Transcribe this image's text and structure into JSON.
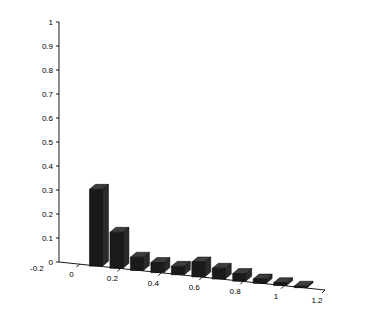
{
  "figure": {
    "background_color": "#ffffff",
    "bar_color": "#1a1a1a",
    "bar_top_color": "#3d3d3d",
    "bar_side_color": "#2b2b2b",
    "axis_color": "#000000"
  },
  "axes": {
    "y_ticks": [
      "1",
      "0.9",
      "0.8",
      "0.7",
      "0.6",
      "0.5",
      "0.4",
      "0.3",
      "0.2",
      "0.1",
      "0"
    ],
    "x_ticks": [
      "0",
      "0.2",
      "0.4",
      "0.6",
      "0.8",
      "1",
      "1.2"
    ],
    "depth_label": "-0.2"
  },
  "chart_data": {
    "type": "bar",
    "title": "",
    "xlabel": "",
    "ylabel": "",
    "style": "3d-bar",
    "categories": [
      "0",
      "0.1",
      "0.2",
      "0.3",
      "0.4",
      "0.5",
      "0.6",
      "0.7",
      "0.8",
      "0.9",
      "1"
    ],
    "x": [
      0,
      0.1,
      0.2,
      0.3,
      0.4,
      0.5,
      0.6,
      0.7,
      0.8,
      0.9,
      1.0
    ],
    "values": [
      0.32,
      0.15,
      0.055,
      0.042,
      0.035,
      0.062,
      0.045,
      0.032,
      0.018,
      0.012,
      0.006
    ],
    "ylim": [
      0,
      1
    ],
    "xlim": [
      -0.1,
      1.2
    ],
    "ytick_values": [
      0,
      0.1,
      0.2,
      0.3,
      0.4,
      0.5,
      0.6,
      0.7,
      0.8,
      0.9,
      1.0
    ],
    "xtick_values": [
      0,
      0.2,
      0.4,
      0.6,
      0.8,
      1.0,
      1.2
    ],
    "grid": false,
    "legend": null
  }
}
